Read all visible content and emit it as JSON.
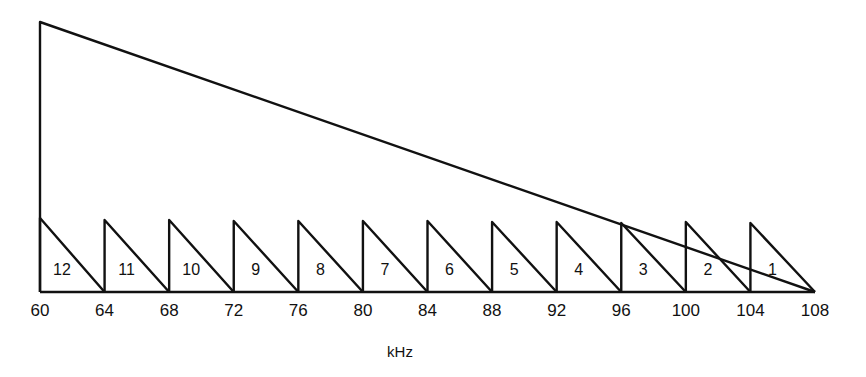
{
  "diagram": {
    "unit_label": "kHz",
    "ticks": [
      "60",
      "64",
      "68",
      "72",
      "76",
      "80",
      "84",
      "88",
      "92",
      "96",
      "100",
      "104",
      "108"
    ],
    "channels": [
      "12",
      "11",
      "10",
      "9",
      "8",
      "7",
      "6",
      "5",
      "4",
      "3",
      "2",
      "1"
    ],
    "line_color": "#111111"
  },
  "chart_data": {
    "type": "diagram",
    "title": "",
    "xlabel": "kHz",
    "x_ticks": [
      60,
      64,
      68,
      72,
      76,
      80,
      84,
      88,
      92,
      96,
      100,
      104,
      108
    ],
    "xlim": [
      60,
      108
    ],
    "envelope": {
      "shape": "right triangle",
      "from_khz": 60,
      "to_khz": 108,
      "peak_at_khz": 60
    },
    "channels": [
      {
        "label": "12",
        "start_khz": 60,
        "end_khz": 64
      },
      {
        "label": "11",
        "start_khz": 64,
        "end_khz": 68
      },
      {
        "label": "10",
        "start_khz": 68,
        "end_khz": 72
      },
      {
        "label": "9",
        "start_khz": 72,
        "end_khz": 76
      },
      {
        "label": "8",
        "start_khz": 76,
        "end_khz": 80
      },
      {
        "label": "7",
        "start_khz": 80,
        "end_khz": 84
      },
      {
        "label": "6",
        "start_khz": 84,
        "end_khz": 88
      },
      {
        "label": "5",
        "start_khz": 88,
        "end_khz": 92
      },
      {
        "label": "4",
        "start_khz": 92,
        "end_khz": 96
      },
      {
        "label": "3",
        "start_khz": 96,
        "end_khz": 100
      },
      {
        "label": "2",
        "start_khz": 100,
        "end_khz": 104
      },
      {
        "label": "1",
        "start_khz": 104,
        "end_khz": 108
      }
    ]
  }
}
